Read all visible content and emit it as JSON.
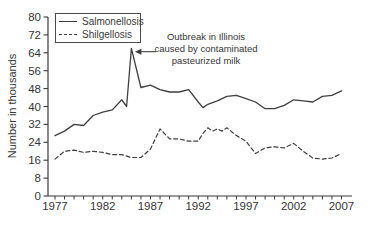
{
  "figure": {
    "y_axis_title": "Number in thousands",
    "legend": [
      {
        "label": "Salmonellosis",
        "style": "solid"
      },
      {
        "label": "Shilgellosis",
        "style": "dashed"
      }
    ],
    "annotation": {
      "lines": [
        "Outbreak in Illinois",
        "caused by contaminated",
        "pasteurized milk"
      ]
    },
    "colors": {
      "line": "#3f3f3f",
      "text": "#363636",
      "axis": "#3a3a3a",
      "background": "#ffffff"
    }
  },
  "chart_data": {
    "type": "line",
    "title": "",
    "xlabel": "",
    "ylabel": "Number in thousands",
    "xlim": [
      1976.27,
      2008.1
    ],
    "ylim": [
      0,
      80
    ],
    "y_ticks": [
      0,
      8,
      16,
      24,
      32,
      40,
      48,
      56,
      64,
      72,
      80
    ],
    "x_major_ticks": [
      1977,
      1982,
      1987,
      1992,
      1997,
      2002,
      2007
    ],
    "x_minor_tick_years": {
      "start": 1977,
      "end": 2007,
      "step": 1
    },
    "grid": false,
    "legend_position": "top-left",
    "series": [
      {
        "name": "Salmonellosis",
        "line_style": "solid",
        "x": [
          1977,
          1978,
          1979,
          1980,
          1981,
          1982,
          1983,
          1984,
          1984.5,
          1985,
          1986,
          1987,
          1988,
          1989,
          1990,
          1991,
          1992,
          1992.5,
          1993,
          1994,
          1995,
          1996,
          1997,
          1998,
          1999,
          2000,
          2001,
          2002,
          2003,
          2004,
          2005,
          2006,
          2007
        ],
        "y": [
          27,
          29,
          32,
          31.5,
          36,
          37.5,
          38.5,
          43,
          40,
          66,
          48.5,
          49.5,
          47.5,
          46.5,
          46.5,
          47.5,
          42,
          39.5,
          41,
          42.5,
          44.5,
          45,
          43.5,
          42,
          39,
          39,
          40.5,
          43,
          42.5,
          42,
          44.5,
          45,
          47
        ]
      },
      {
        "name": "Shilgellosis",
        "line_style": "dashed",
        "x": [
          1977,
          1978,
          1979,
          1980,
          1981,
          1982,
          1983,
          1984,
          1985,
          1986,
          1987,
          1988,
          1989,
          1990,
          1991,
          1992,
          1992.5,
          1993,
          1993.5,
          1994,
          1994.5,
          1995,
          1996,
          1997,
          1998,
          1999,
          2000,
          2001,
          2002,
          2003,
          2004,
          2005,
          2006,
          2007
        ],
        "y": [
          16.5,
          20,
          20.5,
          19.5,
          20,
          19.5,
          18.5,
          18.5,
          17.2,
          17.2,
          21,
          30,
          25.5,
          25.5,
          24.5,
          24.5,
          28,
          30.5,
          29,
          30,
          29,
          30.5,
          27,
          24.5,
          19,
          21.5,
          22,
          21.5,
          23.5,
          20,
          17,
          16.5,
          17,
          19
        ]
      }
    ],
    "annotation": {
      "text": "Outbreak in Illinois caused by contaminated pasteurized milk",
      "points_to": {
        "x": 1985,
        "y": 64.5
      }
    }
  }
}
